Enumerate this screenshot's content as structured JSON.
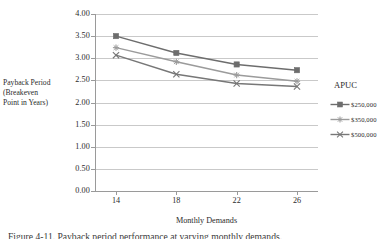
{
  "chart_data": {
    "type": "line",
    "title": "",
    "xlabel": "Monthly Demands",
    "ylabel": "Payback Period (Breakeven Point in Years)",
    "ylabel_lines": [
      "Payback Period",
      "(Breakeven",
      "Point in Years)"
    ],
    "categories": [
      14,
      18,
      22,
      26
    ],
    "x_tick_labels": [
      "14",
      "18",
      "22",
      "26"
    ],
    "y_tick_labels": [
      "4.00",
      "3.50",
      "3.00",
      "2.50",
      "2.00",
      "1.50",
      "1.00",
      "0.50",
      "0.00"
    ],
    "y_tick_values": [
      4.0,
      3.5,
      3.0,
      2.5,
      2.0,
      1.5,
      1.0,
      0.5,
      0.0
    ],
    "ylim": [
      0.0,
      4.0
    ],
    "grid": true,
    "grid_axis": "y",
    "legend_position": "right",
    "legend_title": "APUC",
    "series": [
      {
        "name": "$250,000",
        "values": [
          3.5,
          3.12,
          2.86,
          2.73
        ],
        "color": "#6d6d6d",
        "marker": "square"
      },
      {
        "name": "$350,000",
        "values": [
          3.24,
          2.92,
          2.62,
          2.48
        ],
        "color": "#9b9b9b",
        "marker": "star"
      },
      {
        "name": "$500,000",
        "values": [
          3.07,
          2.64,
          2.43,
          2.36
        ],
        "color": "#777777",
        "marker": "cross"
      }
    ]
  },
  "caption": "Figure 4-11. Payback period performance at varying monthly demands."
}
